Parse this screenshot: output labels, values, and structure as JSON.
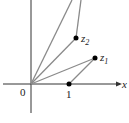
{
  "diagram": {
    "axes": {
      "x_label": "x",
      "origin_label": "0"
    },
    "points": [
      {
        "id": "one",
        "label": "1"
      },
      {
        "id": "z1",
        "label": "z",
        "sub": "1"
      },
      {
        "id": "z2",
        "label": "z",
        "sub": "2"
      }
    ],
    "colors": {
      "axis": "#333333",
      "line": "#8a8a8a",
      "point": "#000000"
    }
  }
}
